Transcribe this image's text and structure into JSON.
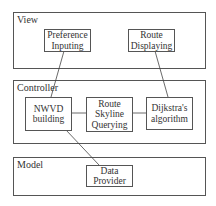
{
  "layers": {
    "view": {
      "label": "View"
    },
    "controller": {
      "label": "Controller"
    },
    "model": {
      "label": "Model"
    }
  },
  "components": {
    "preference_inputing": {
      "label": "Preference\nInputing"
    },
    "route_displaying": {
      "label": "Route\nDisplaying"
    },
    "nwvd_building": {
      "label": "NWVD\nbuilding"
    },
    "route_skyline_querying": {
      "label": "Route\nSkyline\nQuerying"
    },
    "dijkstras_algorithm": {
      "label": "Dijkstra's\nalgorithm"
    },
    "data_provider": {
      "label": "Data\nProvider"
    }
  },
  "connections": [
    {
      "from": "preference_inputing",
      "to": "nwvd_building"
    },
    {
      "from": "route_displaying",
      "to": "dijkstras_algorithm"
    },
    {
      "from": "nwvd_building",
      "to": "route_skyline_querying"
    },
    {
      "from": "route_skyline_querying",
      "to": "dijkstras_algorithm"
    },
    {
      "from": "nwvd_building",
      "to": "data_provider"
    }
  ],
  "colors": {
    "stroke": "#555555",
    "text": "#333333",
    "background": "#ffffff"
  }
}
